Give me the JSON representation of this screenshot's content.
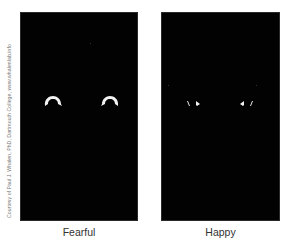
{
  "figure": {
    "credit": "Courtesy of Paul J. Whalen, PhD, Dartmouth College, www.whalenlab.info",
    "panels": [
      {
        "id": "fearful",
        "caption": "Fearful",
        "description": "Eye whites only, wide-open (large arcs) on black background"
      },
      {
        "id": "happy",
        "caption": "Happy",
        "description": "Eye whites only, small slivers on black background"
      }
    ],
    "colors": {
      "background": "#ffffff",
      "panel": "#020202",
      "eye_white": "#f2f2f2",
      "caption_text": "#333333",
      "credit_text": "#777777"
    }
  }
}
